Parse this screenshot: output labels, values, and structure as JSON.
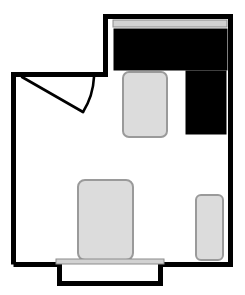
{
  "plan": {
    "title": "Bedroom Floor Plan",
    "canvas": {
      "width": 245,
      "height": 295
    },
    "colors": {
      "wall": "#000000",
      "background": "#ffffff",
      "furniture_fill": "#dcdcdc",
      "furniture_stroke": "#9a9a9a",
      "dark_furniture": "#000000",
      "sill_fill": "#d2d2d2",
      "sill_stroke": "#8c8c8c",
      "door_stroke": "#000000"
    },
    "geometry": {
      "wall_thickness": 5,
      "outline_points": "13.5,264.5 13.5,74.5 105.5,74.5 105.5,16.5 230.5,16.5 230.5,264.5 160.5,264.5 160.5,283.5 59.5,283.5 59.5,264.5",
      "inner_notch_top_y": 74.5
    },
    "walls": [
      {
        "name": "left-wall",
        "x1": 13.5,
        "y1": 74.5,
        "x2": 13.5,
        "y2": 264.5
      },
      {
        "name": "upper-left-wall",
        "x1": 13.5,
        "y1": 74.5,
        "x2": 105.5,
        "y2": 74.5
      },
      {
        "name": "step-wall",
        "x1": 105.5,
        "y1": 74.5,
        "x2": 105.5,
        "y2": 16.5
      },
      {
        "name": "top-wall",
        "x1": 105.5,
        "y1": 16.5,
        "x2": 230.5,
        "y2": 16.5
      },
      {
        "name": "right-wall",
        "x1": 230.5,
        "y1": 16.5,
        "x2": 230.5,
        "y2": 264.5
      },
      {
        "name": "bottom-right-wall",
        "x1": 230.5,
        "y1": 264.5,
        "x2": 160.5,
        "y2": 264.5
      },
      {
        "name": "alcove-right-wall",
        "x1": 160.5,
        "y1": 264.5,
        "x2": 160.5,
        "y2": 283.5
      },
      {
        "name": "alcove-bottom-wall",
        "x1": 160.5,
        "y1": 283.5,
        "x2": 59.5,
        "y2": 283.5
      },
      {
        "name": "alcove-left-wall",
        "x1": 59.5,
        "y1": 283.5,
        "x2": 59.5,
        "y2": 264.5
      },
      {
        "name": "bottom-left-wall",
        "x1": 59.5,
        "y1": 264.5,
        "x2": 13.5,
        "y2": 264.5
      }
    ],
    "door": {
      "name": "entry-door",
      "hinge_x": 22,
      "hinge_y": 77,
      "panel_end_x": 83,
      "panel_end_y": 112,
      "arc_end_x": 94,
      "arc_end_y": 77,
      "panel_path": "M 22 77 L 83 112",
      "arc_path": "M 83 112 A 72 72 0 0 0 94 77"
    },
    "windows": [
      {
        "name": "top-window",
        "label": "Top window",
        "x": 113,
        "y": 20,
        "width": 114,
        "height": 7
      },
      {
        "name": "bay-window-sill",
        "label": "Bay window sill",
        "x": 56,
        "y": 259,
        "width": 108,
        "height": 5
      }
    ],
    "furniture": [
      {
        "name": "bed-top",
        "label": "Bed against top wall",
        "type": "dark",
        "x": 114,
        "y": 29,
        "width": 113,
        "height": 41,
        "radius": 0
      },
      {
        "name": "wardrobe-right",
        "label": "Wardrobe",
        "type": "dark",
        "x": 186,
        "y": 71,
        "width": 40,
        "height": 63,
        "radius": 0
      },
      {
        "name": "nightstand-upper",
        "label": "Nightstand",
        "type": "gray",
        "x": 123,
        "y": 72,
        "width": 44,
        "height": 65,
        "radius": 6
      },
      {
        "name": "bed-center",
        "label": "Bed centre of room",
        "type": "gray",
        "x": 78,
        "y": 180,
        "width": 55,
        "height": 80,
        "radius": 7
      },
      {
        "name": "dresser-lower-right",
        "label": "Dresser",
        "type": "gray",
        "x": 196,
        "y": 195,
        "width": 27,
        "height": 65,
        "radius": 5
      }
    ]
  }
}
